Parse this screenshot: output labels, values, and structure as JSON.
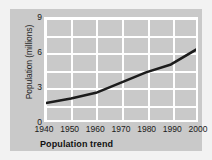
{
  "chart_data": {
    "type": "line",
    "title": "Population trend",
    "xlabel": "",
    "ylabel": "Population (millions)",
    "x": [
      1940,
      1950,
      1960,
      1970,
      1980,
      1990,
      2000
    ],
    "values": [
      1.6,
      2.0,
      2.5,
      3.4,
      4.3,
      5.0,
      6.3
    ],
    "series": [
      {
        "name": "Population",
        "values": [
          1.6,
          2.0,
          2.5,
          3.4,
          4.3,
          5.0,
          6.3
        ]
      }
    ],
    "xlim": [
      1940,
      2000
    ],
    "ylim": [
      0,
      9
    ],
    "xticks": [
      "1940",
      "1950",
      "1960",
      "1970",
      "1980",
      "1990",
      "2000"
    ],
    "yticks": [
      "0",
      "3",
      "6",
      "9"
    ],
    "ytick_values": [
      0,
      3,
      6,
      9
    ],
    "y_gridlines": [
      0,
      1.5,
      3,
      4.5,
      6,
      7.5,
      9
    ],
    "grid": true,
    "legend": "none",
    "colors": {
      "line": "#1c1c1c",
      "panel": "#c9c9c9",
      "grid": "#ffffff",
      "figure_background": "#f2f2f2",
      "text": "#1a1a1a"
    }
  }
}
